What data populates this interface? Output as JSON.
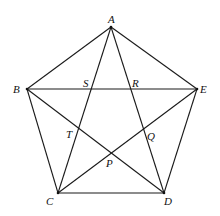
{
  "diagram": {
    "title": "",
    "colors": {
      "line": "#1a1a1a",
      "label": "#111111",
      "background": "#ffffff"
    },
    "vertices": [
      {
        "id": "A",
        "label": "A",
        "x": 111,
        "y": 27,
        "lx": 108,
        "ly": 23
      },
      {
        "id": "B",
        "label": "B",
        "x": 27,
        "y": 89,
        "lx": 13,
        "ly": 93
      },
      {
        "id": "C",
        "label": "C",
        "x": 58,
        "y": 193,
        "lx": 46,
        "ly": 205
      },
      {
        "id": "D",
        "label": "D",
        "x": 164,
        "y": 193,
        "lx": 164,
        "ly": 205
      },
      {
        "id": "E",
        "label": "E",
        "x": 197,
        "y": 89,
        "lx": 200,
        "ly": 93
      }
    ],
    "intersections": [
      {
        "id": "S",
        "label": "S",
        "lx": 83,
        "ly": 87
      },
      {
        "id": "R",
        "label": "R",
        "lx": 132,
        "ly": 87
      },
      {
        "id": "T",
        "label": "T",
        "lx": 66,
        "ly": 138
      },
      {
        "id": "Q",
        "label": "Q",
        "lx": 147,
        "ly": 140
      },
      {
        "id": "P",
        "label": "P",
        "lx": 106,
        "ly": 167
      }
    ],
    "sides": [
      [
        "A",
        "B"
      ],
      [
        "B",
        "C"
      ],
      [
        "C",
        "D"
      ],
      [
        "D",
        "E"
      ],
      [
        "E",
        "A"
      ]
    ],
    "diagonals": [
      [
        "A",
        "C"
      ],
      [
        "A",
        "D"
      ],
      [
        "B",
        "E"
      ],
      [
        "B",
        "D"
      ],
      [
        "C",
        "E"
      ]
    ]
  }
}
